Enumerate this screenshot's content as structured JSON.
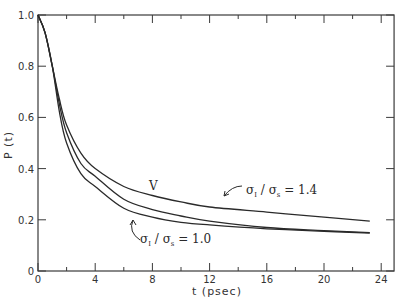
{
  "chart_data": {
    "type": "line",
    "title": "",
    "xlabel": "t (psec)",
    "ylabel": "P (t)",
    "xlim": [
      0,
      24.9
    ],
    "ylim": [
      0,
      1.0
    ],
    "grid": false,
    "legend": "none (curves labeled inline)",
    "x_ticks": {
      "major": [
        0,
        4,
        8,
        12,
        16,
        20,
        24
      ],
      "minor": [
        2,
        6,
        10,
        14,
        18,
        22
      ]
    },
    "x_tick_labels": [
      "0",
      "4",
      "8",
      "12",
      "16",
      "20",
      "24"
    ],
    "y_ticks": [
      0,
      0.2,
      0.4,
      0.6,
      0.8,
      1.0
    ],
    "y_tick_labels": [
      "0",
      "0.2",
      "0.4",
      "0.6",
      "0.8",
      "1.0"
    ],
    "series": [
      {
        "name": "σI / σs = 1.4",
        "x": [
          0,
          0.5,
          1.0,
          1.5,
          2.0,
          3.0,
          4.0,
          6.0,
          8.0,
          10.0,
          12.0,
          16.0,
          20.0,
          23.2
        ],
        "y": [
          1.0,
          0.93,
          0.8,
          0.67,
          0.57,
          0.46,
          0.4,
          0.33,
          0.295,
          0.27,
          0.25,
          0.23,
          0.21,
          0.195
        ]
      },
      {
        "name": "V",
        "x": [
          0,
          0.5,
          1.0,
          1.5,
          2.0,
          3.0,
          4.0,
          6.0,
          8.0,
          10.0,
          12.0,
          16.0,
          20.0,
          23.2
        ],
        "y": [
          1.0,
          0.93,
          0.8,
          0.65,
          0.54,
          0.42,
          0.37,
          0.28,
          0.24,
          0.215,
          0.195,
          0.17,
          0.158,
          0.15
        ]
      },
      {
        "name": "σI / σs = 1.0",
        "x": [
          0,
          0.5,
          1.0,
          1.5,
          2.0,
          3.0,
          4.0,
          6.0,
          8.0,
          10.0,
          12.0,
          16.0,
          20.0,
          23.2
        ],
        "y": [
          1.0,
          0.93,
          0.8,
          0.62,
          0.5,
          0.38,
          0.33,
          0.245,
          0.21,
          0.19,
          0.18,
          0.165,
          0.155,
          0.148
        ]
      }
    ],
    "annotations": [
      {
        "text": "σI / σs = 1.4",
        "target_series": "σI / σs = 1.4",
        "near": [
          13.5,
          0.27
        ]
      },
      {
        "text": "V",
        "target_series": "V",
        "near": [
          8.0,
          0.25
        ]
      },
      {
        "text": "σI / σs = 1.0",
        "target_series": "σI / σs = 1.0",
        "near": [
          7.5,
          0.13
        ]
      }
    ]
  },
  "labels": {
    "xlabel": "t (psec)",
    "ylabel": "P (t)",
    "annot_14_main": "σ",
    "annot_14_sub1": "I",
    "annot_14_slash": " / σ",
    "annot_14_sub2": "s",
    "annot_14_val": " = 1.4",
    "annot_10_main": "σ",
    "annot_10_sub1": "I",
    "annot_10_slash": " / σ",
    "annot_10_sub2": "s",
    "annot_10_val": " = 1.0",
    "annot_v": "V"
  }
}
